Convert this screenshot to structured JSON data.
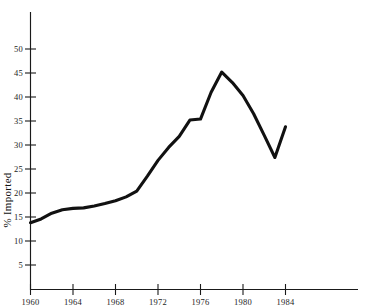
{
  "chart_data": {
    "type": "line",
    "title": "",
    "subtitle": "",
    "xlabel": "",
    "ylabel": "% Imported",
    "xlim": [
      1960,
      1988
    ],
    "ylim": [
      0,
      55
    ],
    "grid": false,
    "legend": null,
    "x_ticks": [
      1960,
      1964,
      1968,
      1972,
      1976,
      1980,
      1984
    ],
    "x_tick_labels": [
      "1960",
      "1964",
      "1968",
      "1972",
      "1976",
      "1980",
      "1984"
    ],
    "y_ticks": [
      5,
      10,
      15,
      20,
      25,
      30,
      35,
      40,
      45,
      50
    ],
    "y_tick_labels": [
      "5",
      "10",
      "15",
      "20",
      "25",
      "30",
      "35",
      "40",
      "45",
      "50"
    ],
    "series": [
      {
        "name": "% Imported",
        "color": "#111111",
        "x": [
          1960,
          1961,
          1962,
          1963,
          1964,
          1965,
          1966,
          1967,
          1968,
          1969,
          1970,
          1971,
          1972,
          1973,
          1974,
          1975,
          1976,
          1977,
          1978,
          1979,
          1980,
          1981,
          1982,
          1983,
          1984
        ],
        "values": [
          13.8,
          14.6,
          15.8,
          16.5,
          16.8,
          16.9,
          17.3,
          17.8,
          18.4,
          19.2,
          20.4,
          23.5,
          26.8,
          29.5,
          31.8,
          35.2,
          35.4,
          41.0,
          45.2,
          43.0,
          40.3,
          36.5,
          32.0,
          27.4,
          33.8
        ]
      }
    ],
    "annotations": []
  },
  "axes": {
    "y_axis_name": "y-axis",
    "x_axis_name": "x-axis"
  }
}
